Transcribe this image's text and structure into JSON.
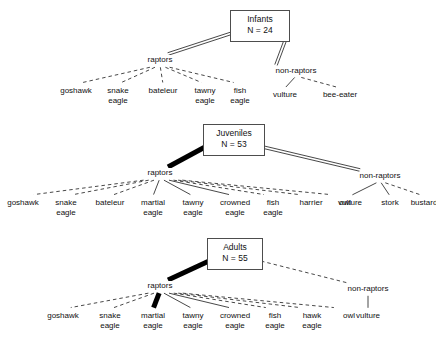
{
  "figure": {
    "background": "#ffffff",
    "line_color": "#333333",
    "box_border_color": "#4d4d4d"
  },
  "panels": [
    {
      "id": "infants",
      "root": {
        "title": "Infants",
        "count": "N = 24",
        "x": 230,
        "y": 10,
        "w": 60,
        "h": 32
      },
      "groups": [
        {
          "id": "infants-raptors",
          "label": "raptors",
          "x": 160,
          "y": 55,
          "link_style": "double",
          "leaves": [
            {
              "label": "goshawk",
              "x": 76,
              "y": 86,
              "style": "dashed"
            },
            {
              "label": "snake\neagle",
              "x": 118,
              "y": 86,
              "style": "dashed"
            },
            {
              "label": "bateleur",
              "x": 163,
              "y": 86,
              "style": "dashed"
            },
            {
              "label": "tawny\neagle",
              "x": 205,
              "y": 86,
              "style": "dashed"
            },
            {
              "label": "fish\neagle",
              "x": 240,
              "y": 86,
              "style": "dashed"
            }
          ]
        },
        {
          "id": "infants-non-raptors",
          "label": "non-raptors",
          "x": 296,
          "y": 66,
          "link_style": "double",
          "leaves": [
            {
              "label": "vulture",
              "x": 285,
              "y": 90,
              "style": "solid-thin"
            },
            {
              "label": "bee-eater",
              "x": 340,
              "y": 90,
              "style": "dashed"
            }
          ]
        }
      ]
    },
    {
      "id": "juveniles",
      "root": {
        "title": "Juveniles",
        "count": "N = 53",
        "x": 203,
        "y": 124,
        "w": 62,
        "h": 32
      },
      "groups": [
        {
          "id": "juveniles-raptors",
          "label": "raptors",
          "x": 160,
          "y": 168,
          "link_style": "thick",
          "leaves": [
            {
              "label": "goshawk",
              "x": 23,
              "y": 198,
              "style": "dashed"
            },
            {
              "label": "snake\neagle",
              "x": 66,
              "y": 198,
              "style": "dashed"
            },
            {
              "label": "bateleur",
              "x": 110,
              "y": 198,
              "style": "dashed"
            },
            {
              "label": "martial\neagle",
              "x": 153,
              "y": 198,
              "style": "solid-thin"
            },
            {
              "label": "tawny\neagle",
              "x": 193,
              "y": 198,
              "style": "solid-thin"
            },
            {
              "label": "crowned\neagle",
              "x": 235,
              "y": 198,
              "style": "solid-thin"
            },
            {
              "label": "fish\neagle",
              "x": 273,
              "y": 198,
              "style": "dashed"
            },
            {
              "label": "harrier",
              "x": 311,
              "y": 198,
              "style": "dashed"
            },
            {
              "label": "owl",
              "x": 345,
              "y": 198,
              "style": "dashed"
            }
          ]
        },
        {
          "id": "juveniles-non-raptors",
          "label": "non-raptors",
          "x": 380,
          "y": 171,
          "link_style": "double",
          "leaves": [
            {
              "label": "vulture",
              "x": 350,
              "y": 198,
              "style": "solid-thin"
            },
            {
              "label": "stork",
              "x": 390,
              "y": 198,
              "style": "solid-thin"
            },
            {
              "label": "bustard",
              "x": 424,
              "y": 198,
              "style": "dashed"
            }
          ]
        }
      ]
    },
    {
      "id": "adults",
      "root": {
        "title": "Adults",
        "count": "N = 55",
        "x": 207,
        "y": 238,
        "w": 56,
        "h": 32
      },
      "groups": [
        {
          "id": "adults-raptors",
          "label": "raptors",
          "x": 160,
          "y": 281,
          "link_style": "thick",
          "leaves": [
            {
              "label": "goshawk",
              "x": 63,
              "y": 311,
              "style": "dashed"
            },
            {
              "label": "snake\neagle",
              "x": 110,
              "y": 311,
              "style": "dashed"
            },
            {
              "label": "martial\neagle",
              "x": 153,
              "y": 311,
              "style": "thick"
            },
            {
              "label": "tawny\neagle",
              "x": 193,
              "y": 311,
              "style": "solid-thin"
            },
            {
              "label": "crowned\neagle",
              "x": 235,
              "y": 311,
              "style": "solid-thin"
            },
            {
              "label": "fish\neagle",
              "x": 275,
              "y": 311,
              "style": "dashed"
            },
            {
              "label": "hawk\neagle",
              "x": 312,
              "y": 311,
              "style": "dashed"
            },
            {
              "label": "owl",
              "x": 349,
              "y": 311,
              "style": "dashed"
            }
          ]
        },
        {
          "id": "adults-non-raptors",
          "label": "non-raptors",
          "x": 368,
          "y": 284,
          "link_style": "dashed",
          "leaves": [
            {
              "label": "vulture",
              "x": 368,
              "y": 311,
              "style": "solid-thin"
            }
          ]
        }
      ]
    }
  ]
}
